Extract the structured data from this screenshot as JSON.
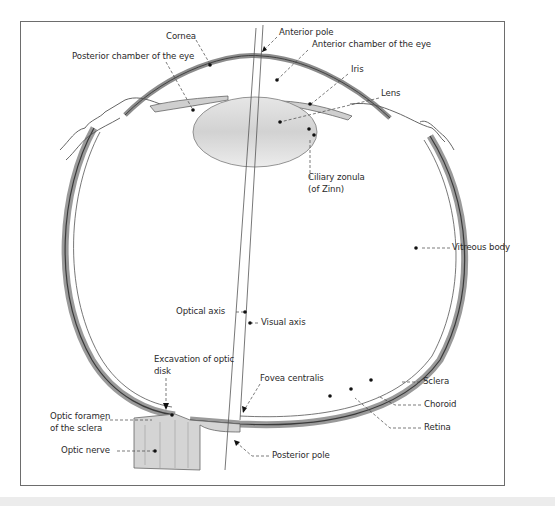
{
  "diagram": {
    "labels": {
      "cornea": "Cornea",
      "posterior_chamber": "Posterior chamber of the eye",
      "anterior_pole": "Anterior pole",
      "anterior_chamber": "Anterior chamber of the eye",
      "iris": "Iris",
      "lens": "Lens",
      "ciliary_zonula_line1": "Ciliary zonula",
      "ciliary_zonula_line2": "(of Zinn)",
      "vitreous_body": "Vitreous body",
      "optical_axis": "Optical axis",
      "visual_axis": "Visual axis",
      "excavation_line1": "Excavation of optic",
      "excavation_line2": "disk",
      "fovea_centralis": "Fovea centralis",
      "sclera": "Sclera",
      "choroid": "Choroid",
      "retina": "Retina",
      "optic_foramen_line1": "Optic foramen",
      "optic_foramen_line2": "of the sclera",
      "optic_nerve": "Optic nerve",
      "posterior_pole": "Posterior pole"
    },
    "colors": {
      "frame": "#6d6d6d",
      "ink": "#2a2a2a",
      "tissue_shade": "#bdbdbd",
      "lens_fill": "#dcdcdc"
    }
  }
}
